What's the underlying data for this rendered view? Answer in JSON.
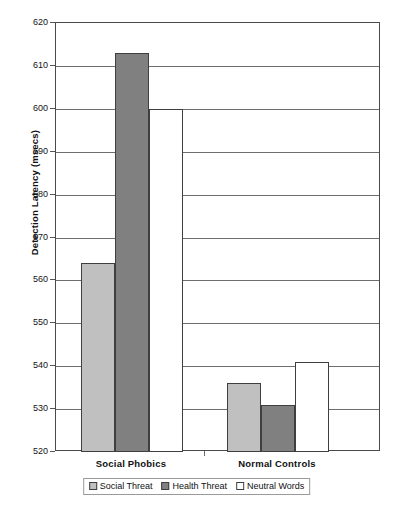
{
  "chart_data": {
    "type": "bar",
    "title": "",
    "subtitle": "",
    "xlabel": "",
    "ylabel": "Detection Latency (msecs)",
    "categories": [
      "Social Phobics",
      "Normal Controls"
    ],
    "series": [
      {
        "name": "Social Threat",
        "color": "#c0c0c0",
        "values": [
          564,
          536
        ]
      },
      {
        "name": "Health Threat",
        "color": "#808080",
        "values": [
          613,
          531
        ]
      },
      {
        "name": "Neutral Words",
        "color": "#ffffff",
        "values": [
          600,
          541
        ]
      }
    ],
    "ylim": [
      520,
      620
    ],
    "ytick_step": 10,
    "ytick_labels": [
      "620",
      "610",
      "600",
      "590",
      "580",
      "570",
      "560",
      "550",
      "540",
      "530",
      "520"
    ],
    "grid": true,
    "legend_position": "bottom",
    "bar_border_color": "#3f3f3f",
    "axis_color": "#4a4a4a",
    "gridline_color": "#6e6e6e"
  }
}
